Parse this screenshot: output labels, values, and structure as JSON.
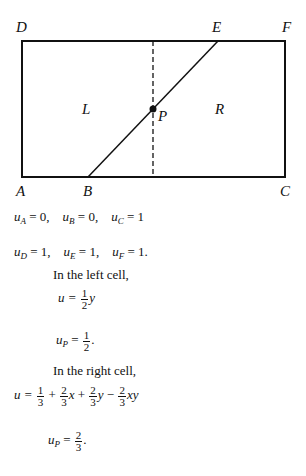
{
  "figure": {
    "points": {
      "A": "A",
      "B": "B",
      "C": "C",
      "D": "D",
      "E": "E",
      "F": "F",
      "P": "P"
    },
    "regions": {
      "left": "L",
      "right": "R"
    }
  },
  "values": {
    "row1": [
      {
        "sub": "A",
        "val": "= 0,"
      },
      {
        "sub": "B",
        "val": "= 0,"
      },
      {
        "sub": "C",
        "val": "= 1"
      }
    ],
    "row2": [
      {
        "sub": "D",
        "val": "= 1,"
      },
      {
        "sub": "E",
        "val": "= 1,"
      },
      {
        "sub": "F",
        "val": "= 1."
      }
    ]
  },
  "left_cell": {
    "heading": "In the left cell,",
    "u_lhs": "u =",
    "coef_num": "1",
    "coef_den": "2",
    "var": "y",
    "up_lhs": "u",
    "up_sub": "P",
    "up_eq": "=",
    "up_num": "1",
    "up_den": "2",
    "up_end": "."
  },
  "right_cell": {
    "heading": "In the right cell,",
    "u_lhs": "u =",
    "terms": [
      {
        "sign": "",
        "num": "1",
        "den": "3",
        "var": ""
      },
      {
        "sign": "+",
        "num": "2",
        "den": "3",
        "var": "x"
      },
      {
        "sign": "+",
        "num": "2",
        "den": "3",
        "var": "y"
      },
      {
        "sign": "−",
        "num": "2",
        "den": "3",
        "var": "xy"
      }
    ],
    "up_lhs": "u",
    "up_sub": "P",
    "up_eq": "=",
    "up_num": "2",
    "up_den": "3",
    "up_end": "."
  }
}
